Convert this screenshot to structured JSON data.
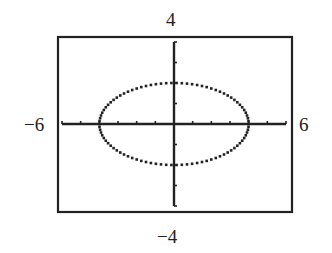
{
  "chart_data": {
    "type": "line",
    "title": "",
    "xlabel": "",
    "ylabel": "",
    "xlim": [
      -6,
      6
    ],
    "ylim": [
      -4,
      4
    ],
    "xtick_step": 1,
    "ytick_step": 1,
    "grid": false,
    "series": [
      {
        "name": "ellipse",
        "equation": "x^2/16 + y^2/4 = 1",
        "center": [
          0,
          0
        ],
        "semi_axis_x": 4,
        "semi_axis_y": 2
      }
    ],
    "window_labels": {
      "ymax": "4",
      "ymin": "−4",
      "xmin": "−6",
      "xmax": "6"
    }
  },
  "labels": {
    "top": "4",
    "bottom": "−4",
    "left": "−6",
    "right": "6"
  }
}
